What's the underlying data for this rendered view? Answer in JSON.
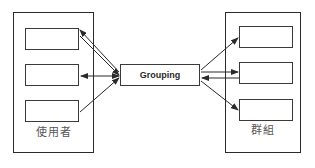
{
  "diagram": {
    "type": "relationship-mapping",
    "left_group": {
      "label": "使用者",
      "items": [
        {
          "id": "user-1"
        },
        {
          "id": "user-2"
        },
        {
          "id": "user-3"
        }
      ]
    },
    "center": {
      "label": "Grouping"
    },
    "right_group": {
      "label": "群組",
      "items": [
        {
          "id": "group-1"
        },
        {
          "id": "group-2"
        },
        {
          "id": "group-3"
        }
      ]
    },
    "connections": [
      {
        "from": "Grouping",
        "to": "user-1",
        "arrowhead": "end"
      },
      {
        "from": "user-1",
        "to": "Grouping",
        "arrowhead": "end"
      },
      {
        "from": "Grouping",
        "to": "user-2",
        "arrowhead": "both"
      },
      {
        "from": "user-3",
        "to": "Grouping",
        "arrowhead": "end"
      },
      {
        "from": "Grouping",
        "to": "group-1",
        "arrowhead": "end"
      },
      {
        "from": "Grouping",
        "to": "group-2",
        "arrowhead": "end"
      },
      {
        "from": "group-2",
        "to": "Grouping",
        "arrowhead": "end"
      },
      {
        "from": "Grouping",
        "to": "group-3",
        "arrowhead": "end"
      }
    ],
    "colors": {
      "line": "#2a2a2a",
      "label_text": "#555555",
      "background": "#ffffff"
    }
  }
}
